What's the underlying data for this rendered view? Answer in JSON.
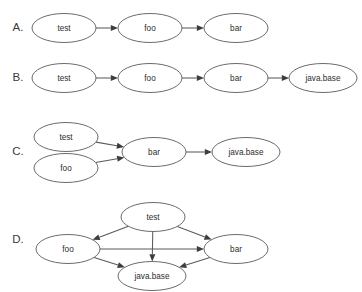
{
  "figure": {
    "background": "#ffffff",
    "stroke_color": "#5a5a5a",
    "arrow_color": "#3d3d3d",
    "text_color": "#2e2e2e",
    "width": 362,
    "height": 292
  },
  "panels": [
    {
      "id": "panel-a",
      "label": "A.",
      "label_x": 18,
      "label_y": 28,
      "nodes": [
        {
          "id": "test",
          "label": "test",
          "cx": 64,
          "cy": 28,
          "rx": 32,
          "ry": 14.5
        },
        {
          "id": "foo",
          "label": "foo",
          "cx": 150,
          "cy": 28,
          "rx": 32,
          "ry": 14.5
        },
        {
          "id": "bar",
          "label": "bar",
          "cx": 236,
          "cy": 28,
          "rx": 32,
          "ry": 14.5
        }
      ],
      "edges": [
        {
          "from": "test",
          "to": "foo"
        },
        {
          "from": "foo",
          "to": "bar"
        }
      ]
    },
    {
      "id": "panel-b",
      "label": "B.",
      "label_x": 18,
      "label_y": 78,
      "nodes": [
        {
          "id": "test",
          "label": "test",
          "cx": 64,
          "cy": 78,
          "rx": 32,
          "ry": 14.5
        },
        {
          "id": "foo",
          "label": "foo",
          "cx": 150,
          "cy": 78,
          "rx": 32,
          "ry": 14.5
        },
        {
          "id": "bar",
          "label": "bar",
          "cx": 236,
          "cy": 78,
          "rx": 32,
          "ry": 14.5
        },
        {
          "id": "javabase",
          "label": "java.base",
          "cx": 323,
          "cy": 78,
          "rx": 34,
          "ry": 14.5
        }
      ],
      "edges": [
        {
          "from": "test",
          "to": "foo"
        },
        {
          "from": "foo",
          "to": "bar"
        },
        {
          "from": "bar",
          "to": "javabase"
        }
      ]
    },
    {
      "id": "panel-c",
      "label": "C.",
      "label_x": 18,
      "label_y": 152,
      "nodes": [
        {
          "id": "test",
          "label": "test",
          "cx": 66,
          "cy": 137,
          "rx": 32,
          "ry": 14.5
        },
        {
          "id": "foo",
          "label": "foo",
          "cx": 66,
          "cy": 168,
          "rx": 32,
          "ry": 14.5
        },
        {
          "id": "bar",
          "label": "bar",
          "cx": 154,
          "cy": 152,
          "rx": 32,
          "ry": 14.5
        },
        {
          "id": "javabase",
          "label": "java.base",
          "cx": 246,
          "cy": 152,
          "rx": 34,
          "ry": 14.5
        }
      ],
      "edges": [
        {
          "from": "test",
          "to": "bar"
        },
        {
          "from": "foo",
          "to": "bar"
        },
        {
          "from": "bar",
          "to": "javabase"
        }
      ]
    },
    {
      "id": "panel-d",
      "label": "D.",
      "label_x": 18,
      "label_y": 240,
      "nodes": [
        {
          "id": "test",
          "label": "test",
          "cx": 153,
          "cy": 217,
          "rx": 32,
          "ry": 14.5
        },
        {
          "id": "foo",
          "label": "foo",
          "cx": 68,
          "cy": 249,
          "rx": 32,
          "ry": 14.5
        },
        {
          "id": "bar",
          "label": "bar",
          "cx": 236,
          "cy": 249,
          "rx": 32,
          "ry": 14.5
        },
        {
          "id": "javabase",
          "label": "java.base",
          "cx": 152,
          "cy": 276,
          "rx": 34,
          "ry": 14.5
        }
      ],
      "edges": [
        {
          "from": "test",
          "to": "foo"
        },
        {
          "from": "test",
          "to": "bar"
        },
        {
          "from": "test",
          "to": "javabase"
        },
        {
          "from": "foo",
          "to": "bar"
        },
        {
          "from": "foo",
          "to": "javabase"
        },
        {
          "from": "bar",
          "to": "javabase"
        }
      ]
    }
  ]
}
